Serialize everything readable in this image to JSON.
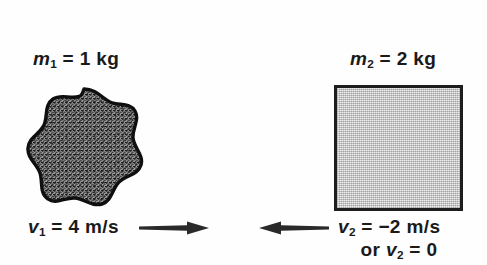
{
  "figure": {
    "background_color": "#ffffff",
    "text_color": "#1a1a1a"
  },
  "objects": {
    "left": {
      "shape_name": "irregular-blob",
      "shape_fill": "#8c8c8c",
      "shape_outline": "#111111",
      "mass_label": "m₁ = 1 kg",
      "mass_symbol": "m",
      "mass_subscript": "1",
      "mass_value": "= 1 kg",
      "velocity_label": "v₁ = 4 m/s",
      "velocity_symbol": "v",
      "velocity_subscript": "1",
      "velocity_value": "= 4 m/s",
      "arrow_direction": "right",
      "arrow_color": "#2a2a2a"
    },
    "right": {
      "shape_name": "square-block",
      "shape_fill": "#d5d5d5",
      "shape_outline": "#1d1d1d",
      "mass_label": "m₂ = 2 kg",
      "mass_symbol": "m",
      "mass_subscript": "2",
      "mass_value": "= 2 kg",
      "velocity_label": "v₂ = −2 m/s",
      "velocity_symbol": "v",
      "velocity_subscript": "2",
      "velocity_value": "= −2 m/s",
      "velocity_alt_prefix": "or ",
      "velocity_alt_symbol": "v",
      "velocity_alt_subscript": "2",
      "velocity_alt_value": "= 0",
      "velocity_alt_label": "or v₂ = 0",
      "arrow_direction": "left",
      "arrow_color": "#2a2a2a"
    }
  }
}
